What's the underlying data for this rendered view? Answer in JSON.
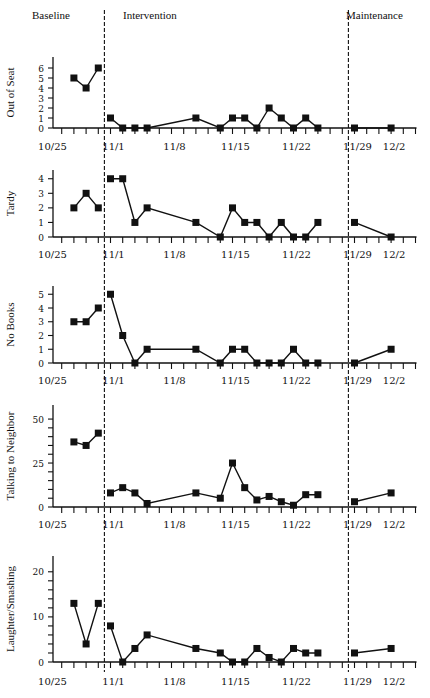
{
  "chart_data": [
    {
      "type": "line",
      "ylabel": "Out of Seat",
      "yticks": [
        0,
        1,
        2,
        3,
        4,
        5,
        6
      ],
      "ylabel_ticks": [
        0,
        1,
        2,
        3,
        4,
        5,
        6
      ],
      "ylim": [
        0,
        7
      ],
      "phases": {
        "baseline": {
          "x": [
            2,
            3,
            4
          ],
          "values": [
            5,
            4,
            6
          ]
        },
        "intervention": {
          "x": [
            5,
            6,
            7,
            8,
            12,
            14,
            15,
            16,
            17,
            18,
            19,
            20,
            21,
            22
          ],
          "values": [
            1,
            0,
            0,
            0,
            1,
            0,
            1,
            1,
            0,
            2,
            1,
            0,
            1,
            0
          ]
        },
        "maintenance": {
          "x": [
            25,
            28
          ],
          "values": [
            0,
            0
          ]
        }
      }
    },
    {
      "type": "line",
      "ylabel": "Tardy",
      "yticks": [
        0,
        1,
        2,
        3,
        4
      ],
      "ylabel_ticks": [
        0,
        1,
        2,
        3,
        4
      ],
      "ylim": [
        0,
        4.6
      ],
      "phases": {
        "baseline": {
          "x": [
            2,
            3,
            4
          ],
          "values": [
            2,
            3,
            2
          ]
        },
        "intervention": {
          "x": [
            5,
            6,
            7,
            8,
            12,
            14,
            15,
            16,
            17,
            18,
            19,
            20,
            21,
            22
          ],
          "values": [
            4,
            4,
            1,
            2,
            1,
            0,
            2,
            1,
            1,
            0,
            1,
            0,
            0,
            1
          ]
        },
        "maintenance": {
          "x": [
            25,
            28
          ],
          "values": [
            1,
            0
          ]
        }
      }
    },
    {
      "type": "line",
      "ylabel": "No Books",
      "yticks": [
        0,
        1,
        2,
        3,
        4,
        5
      ],
      "ylabel_ticks": [
        0,
        1,
        2,
        3,
        4,
        5
      ],
      "ylim": [
        0,
        5.6
      ],
      "phases": {
        "baseline": {
          "x": [
            2,
            3,
            4
          ],
          "values": [
            3,
            3,
            4
          ]
        },
        "intervention": {
          "x": [
            5,
            6,
            7,
            8,
            12,
            14,
            15,
            16,
            17,
            18,
            19,
            20,
            21,
            22
          ],
          "values": [
            5,
            2,
            0,
            1,
            1,
            0,
            1,
            1,
            0,
            0,
            0,
            1,
            0,
            0
          ]
        },
        "maintenance": {
          "x": [
            25,
            28
          ],
          "values": [
            0,
            1
          ]
        }
      }
    },
    {
      "type": "line",
      "ylabel": "Talking to Neighbor",
      "yticks": [
        0,
        5,
        10,
        15,
        20,
        25,
        30,
        35,
        40,
        45,
        50
      ],
      "ylabel_ticks": [
        0,
        25,
        50
      ],
      "ylim": [
        0,
        58
      ],
      "phases": {
        "baseline": {
          "x": [
            2,
            3,
            4
          ],
          "values": [
            37,
            35,
            42
          ]
        },
        "intervention": {
          "x": [
            5,
            6,
            7,
            8,
            12,
            14,
            15,
            16,
            17,
            18,
            19,
            20,
            21,
            22
          ],
          "values": [
            8,
            11,
            8,
            2,
            8,
            5,
            25,
            11,
            4,
            6,
            3,
            1,
            7,
            7
          ]
        },
        "maintenance": {
          "x": [
            25,
            28
          ],
          "values": [
            3,
            8
          ]
        }
      }
    },
    {
      "type": "line",
      "ylabel": "Laughter/Smashing",
      "yticks": [
        0,
        2,
        4,
        6,
        8,
        10,
        12,
        14,
        16,
        18,
        20
      ],
      "ylabel_ticks": [
        0,
        10,
        20
      ],
      "ylim": [
        0,
        23.5
      ],
      "phases": {
        "baseline": {
          "x": [
            2,
            3,
            4
          ],
          "values": [
            13,
            4,
            13
          ]
        },
        "intervention": {
          "x": [
            5,
            6,
            7,
            8,
            12,
            14,
            15,
            16,
            17,
            18,
            19,
            20,
            21,
            22
          ],
          "values": [
            8,
            0,
            3,
            6,
            3,
            2,
            0,
            0,
            3,
            1,
            0,
            3,
            2,
            2
          ]
        },
        "maintenance": {
          "x": [
            25,
            28
          ],
          "values": [
            2,
            3
          ]
        }
      }
    }
  ],
  "phase_labels": {
    "baseline": "Baseline",
    "intervention": "Intervention",
    "maintenance": "Maintenance"
  },
  "xaxis": {
    "num_ticks": 31,
    "labels": [
      {
        "idx": 0,
        "text": "10/25"
      },
      {
        "idx": 5,
        "text": "11/1"
      },
      {
        "idx": 10,
        "text": "11/8"
      },
      {
        "idx": 15,
        "text": "11/15"
      },
      {
        "idx": 20,
        "text": "11/22"
      },
      {
        "idx": 25,
        "text": "11/29"
      },
      {
        "idx": 28,
        "text": "12/2"
      }
    ]
  },
  "phase_lines": [
    4.5,
    24.5
  ]
}
